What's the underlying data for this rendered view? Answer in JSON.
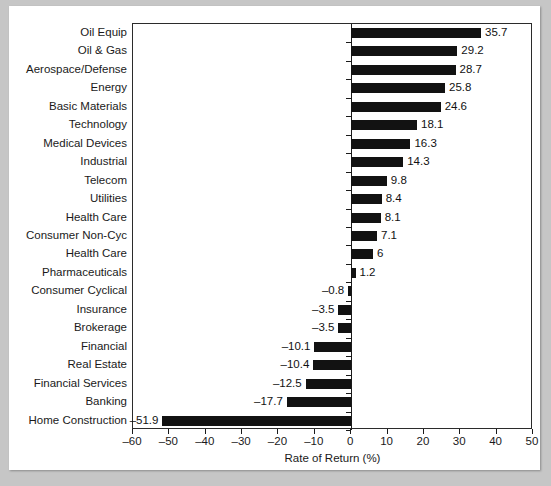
{
  "chart_data": {
    "type": "bar",
    "orientation": "horizontal",
    "title": "",
    "xlabel": "Rate of Return (%)",
    "ylabel": "",
    "xlim": [
      -60,
      50
    ],
    "xticks": [
      -60,
      -50,
      -40,
      -30,
      -20,
      -10,
      0,
      10,
      20,
      30,
      40,
      50
    ],
    "xtick_labels": [
      "–60",
      "–50",
      "–40",
      "–30",
      "–20",
      "–10",
      "0",
      "10",
      "20",
      "30",
      "40",
      "50"
    ],
    "grid": false,
    "legend": false,
    "bar_color": "#121212",
    "categories": [
      "Oil Equip",
      "Oil & Gas",
      "Aerospace/Defense",
      "Energy",
      "Basic Materials",
      "Technology",
      "Medical Devices",
      "Industrial",
      "Telecom",
      "Utilities",
      "Health Care",
      "Consumer Non-Cyc",
      "Health Care",
      "Pharmaceuticals",
      "Consumer Cyclical",
      "Insurance",
      "Brokerage",
      "Financial",
      "Real Estate",
      "Financial Services",
      "Banking",
      "Home Construction"
    ],
    "values": [
      35.7,
      29.2,
      28.7,
      25.8,
      24.6,
      18.1,
      16.3,
      14.3,
      9.8,
      8.4,
      8.1,
      7.1,
      6,
      1.2,
      -0.8,
      -3.5,
      -3.5,
      -10.1,
      -10.4,
      -12.5,
      -17.7,
      -51.9
    ],
    "value_labels": [
      "35.7",
      "29.2",
      "28.7",
      "25.8",
      "24.6",
      "18.1",
      "16.3",
      "14.3",
      "9.8",
      "8.4",
      "8.1",
      "7.1",
      "6",
      "1.2",
      "–0.8",
      "–3.5",
      "–3.5",
      "–10.1",
      "–10.4",
      "–12.5",
      "–17.7",
      "–51.9"
    ]
  }
}
